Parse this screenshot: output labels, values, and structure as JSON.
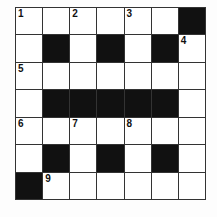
{
  "puzzle": {
    "rows": 7,
    "cols": 7,
    "grid": [
      [
        "1",
        "",
        "2",
        "",
        "3",
        "",
        "#"
      ],
      [
        "",
        "#",
        "",
        "#",
        "",
        "#",
        "4"
      ],
      [
        "5",
        "",
        "",
        "",
        "",
        "",
        ""
      ],
      [
        "",
        "#",
        "#",
        "#",
        "#",
        "#",
        ""
      ],
      [
        "6",
        "",
        "7",
        "",
        "8",
        "",
        ""
      ],
      [
        "",
        "#",
        "",
        "#",
        "",
        "#",
        ""
      ],
      [
        "#",
        "9",
        "",
        "",
        "",
        "",
        ""
      ]
    ]
  }
}
